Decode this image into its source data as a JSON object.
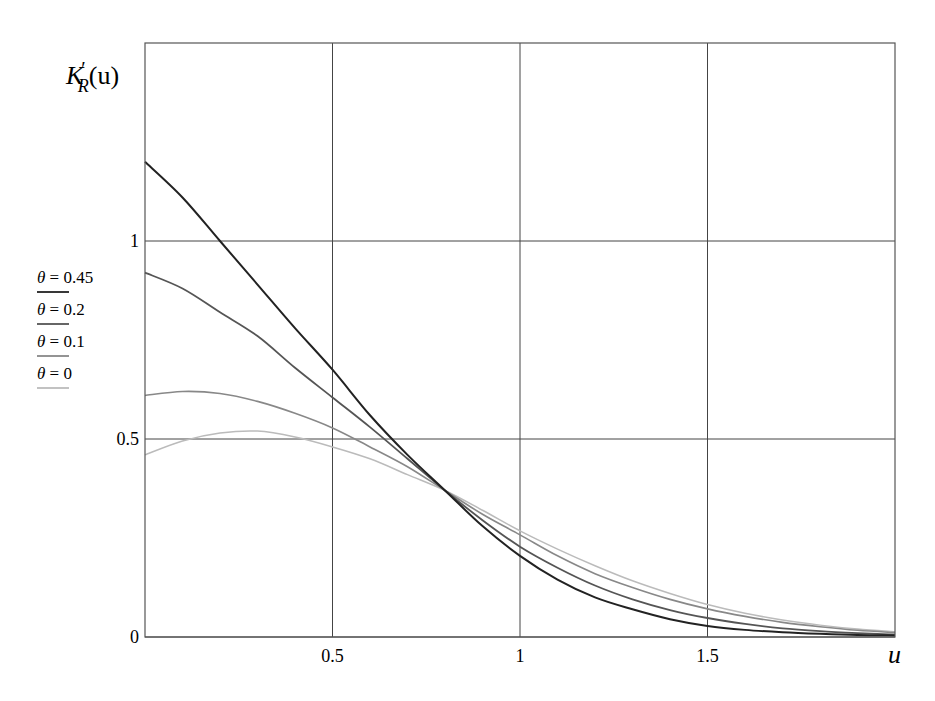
{
  "chart_data": {
    "type": "line",
    "title": "",
    "xlabel": "u",
    "ylabel": "K'_R(u)",
    "xlim": [
      0,
      2
    ],
    "ylim": [
      0,
      1.5
    ],
    "grid": true,
    "legend_position": "left-outside",
    "x_ticks": [
      {
        "value": 0.5,
        "label": "0.5"
      },
      {
        "value": 1,
        "label": "1"
      },
      {
        "value": 1.5,
        "label": "1.5"
      }
    ],
    "y_ticks": [
      {
        "value": 0,
        "label": "0"
      },
      {
        "value": 0.5,
        "label": "0.5"
      },
      {
        "value": 1,
        "label": "1"
      }
    ],
    "x": [
      0,
      0.1,
      0.2,
      0.3,
      0.4,
      0.5,
      0.6,
      0.7,
      0.8,
      0.9,
      1.0,
      1.1,
      1.2,
      1.3,
      1.4,
      1.5,
      1.6,
      1.7,
      1.8,
      1.9,
      2.0
    ],
    "series": [
      {
        "name": "θ = 0.45",
        "color": "#222222",
        "width": 2.0,
        "values": [
          1.2,
          1.11,
          1.0,
          0.89,
          0.78,
          0.675,
          0.56,
          0.46,
          0.37,
          0.28,
          0.205,
          0.145,
          0.1,
          0.07,
          0.045,
          0.028,
          0.018,
          0.012,
          0.008,
          0.005,
          0.004
        ]
      },
      {
        "name": "θ = 0.2",
        "color": "#555555",
        "width": 1.8,
        "values": [
          0.92,
          0.88,
          0.82,
          0.76,
          0.68,
          0.605,
          0.53,
          0.45,
          0.37,
          0.295,
          0.228,
          0.175,
          0.13,
          0.095,
          0.068,
          0.048,
          0.033,
          0.022,
          0.015,
          0.01,
          0.006
        ]
      },
      {
        "name": "θ = 0.1",
        "color": "#888888",
        "width": 1.6,
        "values": [
          0.61,
          0.62,
          0.615,
          0.595,
          0.565,
          0.528,
          0.48,
          0.43,
          0.37,
          0.31,
          0.258,
          0.205,
          0.16,
          0.125,
          0.095,
          0.071,
          0.052,
          0.037,
          0.026,
          0.017,
          0.011
        ]
      },
      {
        "name": "θ = 0",
        "color": "#bbbbbb",
        "width": 1.5,
        "values": [
          0.46,
          0.495,
          0.515,
          0.52,
          0.505,
          0.48,
          0.45,
          0.41,
          0.37,
          0.32,
          0.268,
          0.222,
          0.18,
          0.142,
          0.11,
          0.082,
          0.06,
          0.043,
          0.03,
          0.02,
          0.013
        ]
      }
    ],
    "annotations": [
      "All curves intersect near u ≈ 0.8, K'_R ≈ 0.37"
    ]
  },
  "labels": {
    "ylabel_main": "K",
    "ylabel_prime": "′",
    "ylabel_sub": "R",
    "ylabel_arg": "(u)",
    "xlabel": "u"
  },
  "legend": [
    {
      "theta": "θ",
      "eq": " = 0.45",
      "color": "#222222"
    },
    {
      "theta": "θ",
      "eq": " = 0.2",
      "color": "#555555"
    },
    {
      "theta": "θ",
      "eq": " = 0.1",
      "color": "#888888"
    },
    {
      "theta": "θ",
      "eq": " = 0",
      "color": "#bbbbbb"
    }
  ]
}
